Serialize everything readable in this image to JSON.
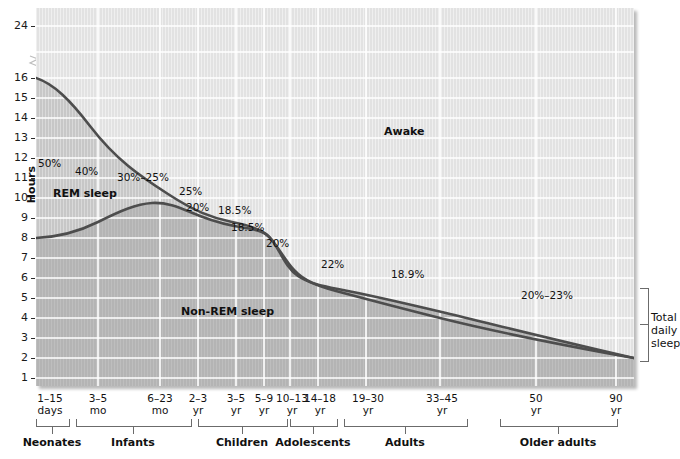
{
  "chart_data": {
    "type": "area",
    "ylabel": "Hours",
    "xlabel": "",
    "ylim": [
      0,
      24
    ],
    "y_axis_break": true,
    "y_ticks": [
      24,
      16,
      15,
      14,
      13,
      12,
      11,
      10,
      9,
      8,
      7,
      6,
      5,
      4,
      3,
      2,
      1
    ],
    "grid": true,
    "categories": [
      "1–15 days",
      "3–5 mo",
      "6–23 mo",
      "2–3 yr",
      "3–5 yr",
      "5–9 yr",
      "10–13 yr",
      "14–18 yr",
      "19–30 yr",
      "33–45 yr",
      "50 yr",
      "90 yr"
    ],
    "series": [
      {
        "name": "Total daily sleep",
        "values": [
          16.0,
          14.0,
          13.0,
          11.8,
          11.0,
          10.2,
          9.3,
          8.4,
          7.6,
          7.0,
          6.1,
          5.2
        ]
      },
      {
        "name": "Non-REM sleep",
        "values": [
          8.0,
          8.5,
          9.4,
          9.0,
          8.7,
          8.5,
          8.3,
          6.4,
          6.0,
          5.6,
          4.9,
          4.0
        ]
      }
    ],
    "bands": [
      {
        "name": "Awake",
        "position": "upper"
      },
      {
        "name": "REM sleep",
        "position": "middle"
      },
      {
        "name": "Non-REM sleep",
        "position": "lower"
      }
    ],
    "annotations": [
      {
        "text": "50%",
        "meaning": "REM share of total sleep"
      },
      {
        "text": "40%",
        "meaning": "REM share of total sleep"
      },
      {
        "text": "30%–25%",
        "meaning": "REM share of total sleep"
      },
      {
        "text": "25%",
        "meaning": "REM share of total sleep"
      },
      {
        "text": "20%",
        "meaning": "REM share of total sleep"
      },
      {
        "text": "18.5%",
        "meaning": "REM share of total sleep"
      },
      {
        "text": "18.5%",
        "meaning": "REM share of total sleep"
      },
      {
        "text": "20%",
        "meaning": "REM share of total sleep"
      },
      {
        "text": "22%",
        "meaning": "REM share of total sleep"
      },
      {
        "text": "18.9%",
        "meaning": "REM share of total sleep"
      },
      {
        "text": "20%–23%",
        "meaning": "REM share of total sleep"
      }
    ],
    "legend_position": "in-plot"
  },
  "axis": {
    "y_label": "Hours",
    "y_ticks": [
      "24",
      "16",
      "15",
      "14",
      "13",
      "12",
      "11",
      "10",
      "9",
      "8",
      "7",
      "6",
      "5",
      "4",
      "3",
      "2",
      "1"
    ],
    "x_ticks": [
      {
        "top": "1–15",
        "bottom": "days"
      },
      {
        "top": "3–5",
        "bottom": "mo"
      },
      {
        "top": "6–23",
        "bottom": "mo"
      },
      {
        "top": "2–3",
        "bottom": "yr"
      },
      {
        "top": "3–5",
        "bottom": "yr"
      },
      {
        "top": "5–9",
        "bottom": "yr"
      },
      {
        "top": "10–13",
        "bottom": "yr"
      },
      {
        "top": "14–18",
        "bottom": "yr"
      },
      {
        "top": "19–30",
        "bottom": "yr"
      },
      {
        "top": "33–45",
        "bottom": "yr"
      },
      {
        "top": "50",
        "bottom": "yr"
      },
      {
        "top": "90",
        "bottom": "yr"
      }
    ]
  },
  "groups": [
    {
      "label": "Neonates"
    },
    {
      "label": "Infants"
    },
    {
      "label": "Children"
    },
    {
      "label": "Adolescents"
    },
    {
      "label": "Adults"
    },
    {
      "label": "Older adults"
    }
  ],
  "band_labels": {
    "awake": "Awake",
    "rem": "REM sleep",
    "nonrem": "Non-REM sleep"
  },
  "percent_labels": [
    "50%",
    "40%",
    "30%–25%",
    "25%",
    "20%",
    "18.5%",
    "18.5%",
    "20%",
    "22%",
    "18.9%",
    "20%–23%"
  ],
  "right_bracket": {
    "line1": "Total",
    "line2": "daily",
    "line3": "sleep"
  },
  "colors": {
    "plot_upper": "#e0e0e0",
    "plot_mid": "#c9c9c9",
    "plot_lower": "#b9b9b9",
    "curve": "#4a4a4a",
    "grid": "#ffffff",
    "text": "#111111",
    "bracket": "#6b6b6b"
  }
}
